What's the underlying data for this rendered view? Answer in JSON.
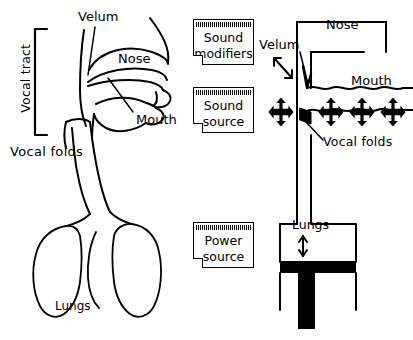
{
  "figure": {
    "background_color": "#ffffff",
    "ink_color": "#000000",
    "width": 413,
    "height": 340
  },
  "left_diagram": {
    "name": "sagittal-vocal-tract",
    "bracket_label": "Vocal tract",
    "labels": {
      "velum": "Velum",
      "nose": "Nose",
      "mouth": "Mouth",
      "vocal_folds": "Vocal folds",
      "lungs": "Lungs"
    }
  },
  "center_notes": {
    "boxes": [
      {
        "id": "sound-modifiers",
        "line1": "Sound",
        "line2": "modifiers"
      },
      {
        "id": "sound-source",
        "line1": "Sound",
        "line2": "source"
      },
      {
        "id": "power-source",
        "line1": "Power",
        "line2": "source"
      }
    ]
  },
  "right_diagram": {
    "name": "tube-model-of-speech-production",
    "labels": {
      "nose": "Nose",
      "velum": "Velum",
      "mouth": "Mouth",
      "vocal_folds": "Vocal folds",
      "lungs": "Lungs"
    },
    "arrows": {
      "velum_arrow": "diagonal-double-headed-arrow",
      "lungs_arrow": "vertical-double-headed-arrow",
      "cross_arrows_count": 4,
      "cross_arrow_glyph": "four-way-cross-arrow"
    }
  }
}
